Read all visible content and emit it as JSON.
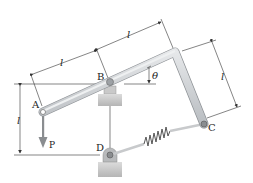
{
  "diagram": {
    "type": "mechanism",
    "labels": {
      "A": "A",
      "B": "B",
      "C": "C",
      "D": "D",
      "P": "P",
      "theta": "θ",
      "len_AB": "l",
      "len_B_corner": "l",
      "len_corner_C": "l",
      "len_vertical_BD": "l"
    },
    "colors": {
      "bar_fill": "#d4d7d9",
      "bar_edge": "#9a9ea2",
      "support_fill": "#cfcfcf",
      "spring": "#555555",
      "line": "#333333",
      "arrow": "#8a8d90"
    }
  }
}
